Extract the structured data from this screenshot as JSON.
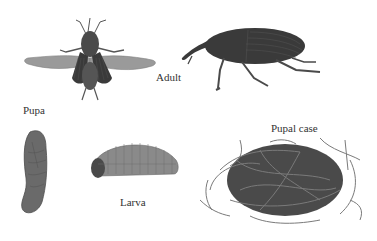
{
  "diagram": {
    "stages": [
      {
        "id": "adult",
        "label": "Adult",
        "views": [
          "dorsal-wings-spread",
          "side-profile"
        ]
      },
      {
        "id": "pupa",
        "label": "Pupa"
      },
      {
        "id": "larva",
        "label": "Larva"
      },
      {
        "id": "pupal-case",
        "label": "Pupal case"
      }
    ]
  },
  "labels": {
    "adult": "Adult",
    "pupa": "Pupa",
    "larva": "Larva",
    "pupal_case": "Pupal case"
  },
  "colors": {
    "background": "#ffffff",
    "label_text": "#333333",
    "insect_dark": "#3a3a3a",
    "insect_mid": "#666666",
    "wing_light": "#9a9a9a",
    "fiber": "#7a7a7a"
  }
}
